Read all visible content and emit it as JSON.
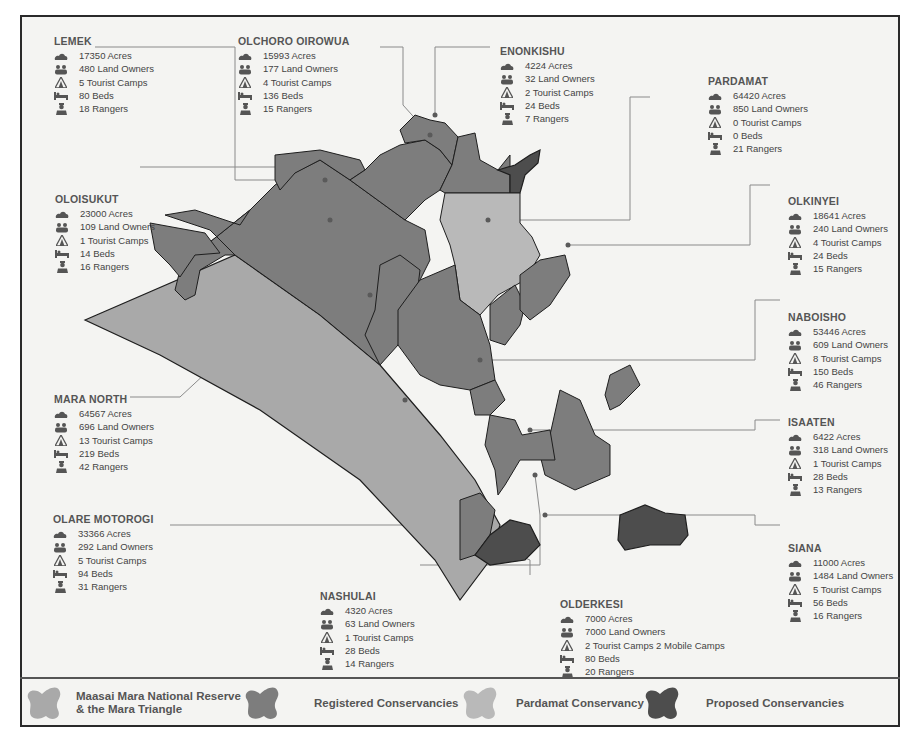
{
  "colors": {
    "reserve": "#a9a9a9",
    "registered": "#7d7d7d",
    "pardamat": "#b9b9b9",
    "proposed": "#4d4d4d",
    "leader_line": "#8a8a8a",
    "frame": "#2a2a2a"
  },
  "icons": [
    "acres-cloud-icon",
    "land-owners-people-icon",
    "tourist-camps-tent-icon",
    "beds-bed-icon",
    "rangers-person-icon"
  ],
  "conservancies": [
    {
      "id": "lemek",
      "name": "LEMEK",
      "acres": "17350 Acres",
      "owners": "480 Land Owners",
      "camps": "5 Tourist Camps",
      "beds": "80 Beds",
      "rangers": "18 Rangers"
    },
    {
      "id": "olchoro",
      "name": "OLCHORO OIROWUA",
      "acres": "15993 Acres",
      "owners": "177 Land Owners",
      "camps": "4 Tourist Camps",
      "beds": "136 Beds",
      "rangers": "15 Rangers"
    },
    {
      "id": "enonkishu",
      "name": "ENONKISHU",
      "acres": "4224 Acres",
      "owners": "32 Land Owners",
      "camps": "2 Tourist Camps",
      "beds": "24 Beds",
      "rangers": "7 Rangers"
    },
    {
      "id": "pardamat",
      "name": "PARDAMAT",
      "acres": "64420 Acres",
      "owners": "850 Land Owners",
      "camps": "0 Tourist Camps",
      "beds": "0 Beds",
      "rangers": "21 Rangers"
    },
    {
      "id": "oloisukut",
      "name": "OLOISUKUT",
      "acres": "23000 Acres",
      "owners": "109 Land Owners",
      "camps": "1 Tourist Camps",
      "beds": "14 Beds",
      "rangers": "16 Rangers"
    },
    {
      "id": "olkinyei",
      "name": "OLKINYEI",
      "acres": "18641 Acres",
      "owners": "240 Land Owners",
      "camps": "4 Tourist Camps",
      "beds": "24 Beds",
      "rangers": "15 Rangers"
    },
    {
      "id": "naboisho",
      "name": "NABOISHO",
      "acres": "53446 Acres",
      "owners": "609 Land Owners",
      "camps": "8 Tourist Camps",
      "beds": "150 Beds",
      "rangers": "46 Rangers"
    },
    {
      "id": "mara_north",
      "name": "MARA NORTH",
      "acres": "64567 Acres",
      "owners": "696 Land Owners",
      "camps": "13 Tourist Camps",
      "beds": "219 Beds",
      "rangers": "42 Rangers"
    },
    {
      "id": "isaaten",
      "name": "ISAATEN",
      "acres": "6422 Acres",
      "owners": "318 Land Owners",
      "camps": "1 Tourist Camps",
      "beds": "28 Beds",
      "rangers": "13 Rangers"
    },
    {
      "id": "olare_motorogi",
      "name": "OLARE MOTOROGI",
      "acres": "33366 Acres",
      "owners": "292 Land Owners",
      "camps": "5 Tourist Camps",
      "beds": "94 Beds",
      "rangers": "31 Rangers"
    },
    {
      "id": "siana",
      "name": "SIANA",
      "acres": "11000 Acres",
      "owners": "1484 Land Owners",
      "camps": "5 Tourist Camps",
      "beds": "56 Beds",
      "rangers": "16 Rangers"
    },
    {
      "id": "nashulai",
      "name": "NASHULAI",
      "acres": "4320 Acres",
      "owners": "63 Land Owners",
      "camps": "1 Tourist Camps",
      "beds": "28 Beds",
      "rangers": "14 Rangers"
    },
    {
      "id": "olderkesi",
      "name": "OLDERKESI",
      "acres": "7000 Acres",
      "owners": "7000 Land Owners",
      "camps": "2 Tourist Camps 2 Mobile Camps",
      "beds": "80 Beds",
      "rangers": "20 Rangers"
    }
  ],
  "legend": [
    {
      "key": "reserve",
      "label_line1": "Maasai Mara National Reserve",
      "label_line2": "& the Mara Triangle"
    },
    {
      "key": "registered",
      "label_line1": "Registered Conservancies",
      "label_line2": ""
    },
    {
      "key": "pardamat",
      "label_line1": "Pardamat Conservancy",
      "label_line2": ""
    },
    {
      "key": "proposed",
      "label_line1": "Proposed Conservancies",
      "label_line2": ""
    }
  ]
}
